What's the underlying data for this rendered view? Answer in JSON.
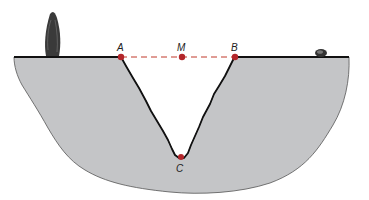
{
  "diagram": {
    "points": {
      "A": {
        "label": "A"
      },
      "M": {
        "label": "M"
      },
      "B": {
        "label": "B"
      },
      "C": {
        "label": "C"
      }
    },
    "colors": {
      "ground": "#c4c5c7",
      "outline": "#111111",
      "point": "#b3262b",
      "dashed_line": "#c0392b",
      "tree": "#333333"
    }
  }
}
